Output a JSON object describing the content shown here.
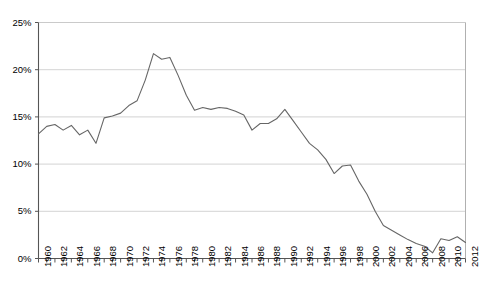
{
  "chart_data": {
    "type": "line",
    "title": "",
    "subtitle": "",
    "xlabel": "",
    "ylabel": "",
    "xlim": [
      1960,
      2012
    ],
    "ylim": [
      0,
      25
    ],
    "ytick_values": [
      0,
      5,
      10,
      15,
      20,
      25
    ],
    "ytick_labels": [
      "0%",
      "5%",
      "10%",
      "15%",
      "20%",
      "25%"
    ],
    "xtick_labels": [
      "1960",
      "1962",
      "1964",
      "1966",
      "1968",
      "1970",
      "1972",
      "1974",
      "1976",
      "1978",
      "1980",
      "1982",
      "1984",
      "1986",
      "1988",
      "1990",
      "1992",
      "1994",
      "1996",
      "1998",
      "2000",
      "2002",
      "2004",
      "2006",
      "2008",
      "2010",
      "2012"
    ],
    "xtick_label_interval": 2,
    "minor_tick_interval": 1,
    "grid": "horizontal",
    "legend": "none",
    "annotations": [],
    "line_color": "#666666",
    "grid_color": "#c8c8c8",
    "axis_color": "#555555",
    "background_color": "#ffffff",
    "x": [
      1960,
      1961,
      1962,
      1963,
      1964,
      1965,
      1966,
      1967,
      1968,
      1969,
      1970,
      1971,
      1972,
      1973,
      1974,
      1975,
      1976,
      1977,
      1978,
      1979,
      1980,
      1981,
      1982,
      1983,
      1984,
      1985,
      1986,
      1987,
      1988,
      1989,
      1990,
      1991,
      1992,
      1993,
      1994,
      1995,
      1996,
      1997,
      1998,
      1999,
      2000,
      2001,
      2002,
      2003,
      2004,
      2005,
      2006,
      2007,
      2008,
      2009,
      2010,
      2011,
      2012
    ],
    "values": [
      13.2,
      14.0,
      14.2,
      13.6,
      14.1,
      13.1,
      13.6,
      12.2,
      14.9,
      15.1,
      15.4,
      16.2,
      16.7,
      18.9,
      21.7,
      21.1,
      21.3,
      19.4,
      17.3,
      15.7,
      16.0,
      15.8,
      16.0,
      15.9,
      15.6,
      15.2,
      13.6,
      14.3,
      14.3,
      14.8,
      15.8,
      14.6,
      13.4,
      12.2,
      11.5,
      10.5,
      9.0,
      9.8,
      9.9,
      8.2,
      6.8,
      5.0,
      3.5,
      3.0,
      2.5,
      2.0,
      1.6,
      1.3,
      0.6,
      2.1,
      1.9,
      2.3,
      1.7
    ],
    "series": [
      {
        "name": "series-1",
        "values": [
          13.2,
          14.0,
          14.2,
          13.6,
          14.1,
          13.1,
          13.6,
          12.2,
          14.9,
          15.1,
          15.4,
          16.2,
          16.7,
          18.9,
          21.7,
          21.1,
          21.3,
          19.4,
          17.3,
          15.7,
          16.0,
          15.8,
          16.0,
          15.9,
          15.6,
          15.2,
          13.6,
          14.3,
          14.3,
          14.8,
          15.8,
          14.6,
          13.4,
          12.2,
          11.5,
          10.5,
          9.0,
          9.8,
          9.9,
          8.2,
          6.8,
          5.0,
          3.5,
          3.0,
          2.5,
          2.0,
          1.6,
          1.3,
          0.6,
          2.1,
          1.9,
          2.3,
          1.7
        ]
      }
    ]
  }
}
